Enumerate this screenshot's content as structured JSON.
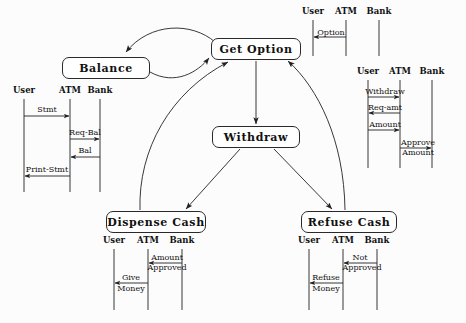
{
  "diagram": {
    "ink_color": "#222222",
    "background_color": "#fcfcfc"
  },
  "states": [
    {
      "id": "balance",
      "label": "Balance",
      "x": 62,
      "y": 57,
      "w": 88,
      "h": 22
    },
    {
      "id": "getoption",
      "label": "Get Option",
      "x": 211,
      "y": 38,
      "w": 90,
      "h": 22
    },
    {
      "id": "withdraw",
      "label": "Withdraw",
      "x": 212,
      "y": 126,
      "w": 88,
      "h": 22
    },
    {
      "id": "dispense",
      "label": "Dispense Cash",
      "x": 106,
      "y": 211,
      "w": 100,
      "h": 22
    },
    {
      "id": "refuse",
      "label": "Refuse Cash",
      "x": 301,
      "y": 211,
      "w": 96,
      "h": 22
    }
  ],
  "transitions": [
    {
      "id": "getoption-to-balance",
      "from": "Get Option",
      "to": "Balance",
      "shape": "curve"
    },
    {
      "id": "balance-to-getoption",
      "from": "Balance",
      "to": "Get Option",
      "shape": "curve"
    },
    {
      "id": "getoption-to-withdraw",
      "from": "Get Option",
      "to": "Withdraw",
      "shape": "line"
    },
    {
      "id": "withdraw-to-dispense",
      "from": "Withdraw",
      "to": "Dispense Cash",
      "shape": "line"
    },
    {
      "id": "withdraw-to-refuse",
      "from": "Withdraw",
      "to": "Refuse Cash",
      "shape": "line"
    },
    {
      "id": "dispense-to-getoption",
      "from": "Dispense Cash",
      "to": "Get Option",
      "shape": "curve"
    },
    {
      "id": "refuse-to-getoption",
      "from": "Refuse Cash",
      "to": "Get Option",
      "shape": "curve"
    }
  ],
  "sequences": [
    {
      "id": "balance-sequence",
      "lifelines": [
        "User",
        "ATM",
        "Bank"
      ],
      "messages": [
        {
          "label": "Stmt",
          "from": "User",
          "to": "ATM",
          "direction": "right"
        },
        {
          "label": "Req-Bal",
          "from": "ATM",
          "to": "Bank",
          "direction": "right"
        },
        {
          "label": "Bal",
          "from": "Bank",
          "to": "ATM",
          "direction": "left"
        },
        {
          "label": "Print-Stmt",
          "from": "ATM",
          "to": "User",
          "direction": "left"
        }
      ]
    },
    {
      "id": "get-option-sequence",
      "lifelines": [
        "User",
        "ATM",
        "Bank"
      ],
      "messages": [
        {
          "label": "Option",
          "from": "ATM",
          "to": "User",
          "direction": "left"
        }
      ]
    },
    {
      "id": "withdraw-sequence",
      "lifelines": [
        "User",
        "ATM",
        "Bank"
      ],
      "messages": [
        {
          "label": "Withdraw",
          "from": "User",
          "to": "ATM",
          "direction": "right"
        },
        {
          "label": "Req-amt",
          "from": "ATM",
          "to": "User",
          "direction": "left"
        },
        {
          "label": "Amount",
          "from": "User",
          "to": "ATM",
          "direction": "right"
        },
        {
          "label": "Approve\nAmount",
          "from": "ATM",
          "to": "Bank",
          "direction": "right"
        }
      ]
    },
    {
      "id": "dispense-cash-sequence",
      "lifelines": [
        "User",
        "ATM",
        "Bank"
      ],
      "messages": [
        {
          "label": "Amount\nApproved",
          "from": "Bank",
          "to": "ATM",
          "direction": "left"
        },
        {
          "label": "Give\nMoney",
          "from": "ATM",
          "to": "User",
          "direction": "left"
        }
      ]
    },
    {
      "id": "refuse-cash-sequence",
      "lifelines": [
        "User",
        "ATM",
        "Bank"
      ],
      "messages": [
        {
          "label": "Not\nApproved",
          "from": "Bank",
          "to": "ATM",
          "direction": "left"
        },
        {
          "label": "Refuse\nMoney",
          "from": "ATM",
          "to": "User",
          "direction": "left"
        }
      ]
    }
  ],
  "labels": {
    "balance": "Balance",
    "get_option": "Get Option",
    "withdraw": "Withdraw",
    "dispense_cash": "Dispense Cash",
    "refuse_cash": "Refuse Cash",
    "user": "User",
    "atm": "ATM",
    "bank": "Bank",
    "stmt": "Stmt",
    "req_bal": "Req-Bal",
    "bal": "Bal",
    "print_stmt": "Print-Stmt",
    "option": "Option",
    "withdraw_msg": "Withdraw",
    "req_amt": "Req-amt",
    "amount": "Amount",
    "approve": "Approve",
    "amount2": "Amount",
    "amount3": "Amount",
    "approved": "Approved",
    "give": "Give",
    "money": "Money",
    "not": "Not",
    "approved2": "Approved",
    "refuse": "Refuse",
    "money2": "Money"
  }
}
